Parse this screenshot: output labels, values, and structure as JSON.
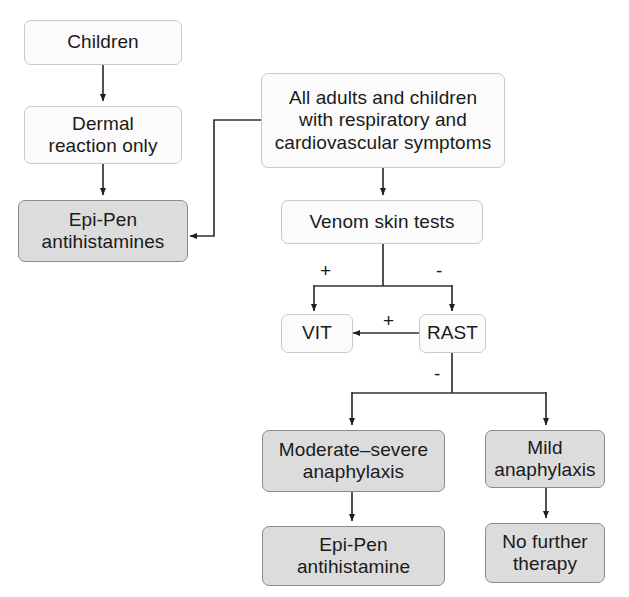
{
  "diagram": {
    "colors": {
      "white_node_fill": "#fbfbfb",
      "white_node_border": "#c9c9c9",
      "gray_node_fill": "#dcdcdc",
      "gray_node_border": "#8c8c8c",
      "connector": "#333333",
      "text": "#1a1a1a",
      "background": "#ffffff"
    },
    "nodes": {
      "children": "Children",
      "dermal_reaction": "Dermal\nreaction only",
      "epipen_antihistamines": "Epi-Pen\nantihistamines",
      "all_adults_children": "All adults and children\nwith respiratory and\ncardiovascular symptoms",
      "venom_skin_tests": "Venom skin tests",
      "vit": "VIT",
      "rast": "RAST",
      "moderate_severe": "Moderate–severe\nanaphylaxis",
      "mild_anaphylaxis": "Mild\nanaphylaxis",
      "epipen_antihistamine": "Epi-Pen\nantihistamine",
      "no_further_therapy": "No further\ntherapy"
    },
    "edge_labels": {
      "skin_test_positive": "+",
      "skin_test_negative": "-",
      "rast_positive": "+",
      "rast_negative": "-"
    }
  }
}
